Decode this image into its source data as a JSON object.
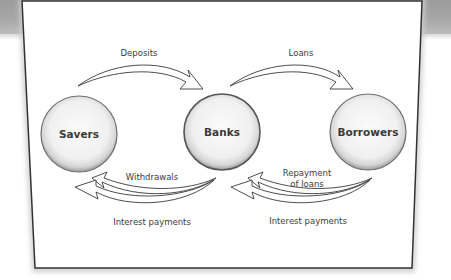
{
  "diagram": {
    "nodes": [
      {
        "id": "savers",
        "label": "Savers"
      },
      {
        "id": "banks",
        "label": "Banks"
      },
      {
        "id": "borrowers",
        "label": "Borrowers"
      }
    ],
    "flows": {
      "deposits": {
        "from": "savers",
        "to": "banks",
        "label": "Deposits"
      },
      "loans": {
        "from": "banks",
        "to": "borrowers",
        "label": "Loans"
      },
      "withdrawals": {
        "from": "banks",
        "to": "savers",
        "label": "Withdrawals"
      },
      "interest_to_savers": {
        "from": "banks",
        "to": "savers",
        "label": "Interest payments"
      },
      "repayment": {
        "from": "borrowers",
        "to": "banks",
        "label_line1": "Repayment",
        "label_line2": "of loans"
      },
      "interest_to_banks": {
        "from": "borrowers",
        "to": "banks",
        "label": "Interest payments"
      }
    },
    "colors": {
      "frame": "#333333",
      "band": "#a5a5a5",
      "circle_fill": "#f4f4f4",
      "circle_stroke": "#6e6e6e",
      "arrow_stroke": "#3a3a3a"
    }
  }
}
